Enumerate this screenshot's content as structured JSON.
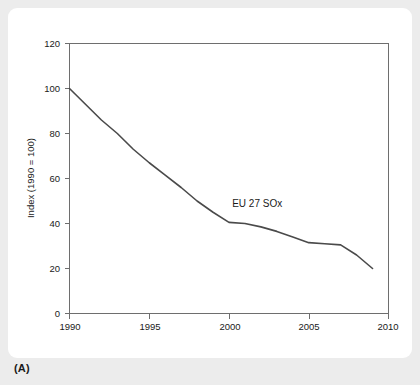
{
  "figure": {
    "caption": "(A)"
  },
  "chart_data": {
    "type": "line",
    "title": "",
    "subtitle": "",
    "xlabel": "",
    "ylabel": "Index (1990 = 100)",
    "xlim": [
      1990,
      2010
    ],
    "ylim": [
      0,
      120
    ],
    "grid": false,
    "legend_position": "inline-annotation",
    "x_ticks": [
      1990,
      1995,
      2000,
      2005,
      2010
    ],
    "x_tick_labels": [
      "1990",
      "1995",
      "2000",
      "2005",
      "2010"
    ],
    "y_ticks": [
      0,
      20,
      40,
      60,
      80,
      100,
      120
    ],
    "y_tick_labels": [
      "0",
      "20",
      "40",
      "60",
      "80",
      "100",
      "120"
    ],
    "annotations": [
      {
        "text": "EU 27 SOx",
        "x": 2000.2,
        "y": 47.5
      }
    ],
    "series": [
      {
        "name": "EU 27 SOx",
        "color": "#4a4a4a",
        "x": [
          1990,
          1991,
          1992,
          1993,
          1994,
          1995,
          1996,
          1997,
          1998,
          1999,
          2000,
          2001,
          2002,
          2003,
          2004,
          2005,
          2006,
          2007,
          2008,
          2009
        ],
        "values": [
          100,
          93,
          86,
          80,
          73,
          67,
          61.5,
          56,
          50,
          45,
          40.5,
          40,
          38.5,
          36.5,
          34,
          31.5,
          31,
          30.5,
          26,
          20
        ]
      }
    ]
  }
}
